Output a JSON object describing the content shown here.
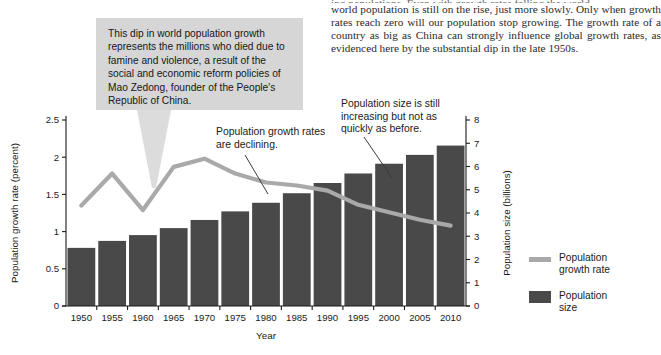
{
  "body_copy": {
    "clipped_top_line": "ing populations. Even with growth rates falling the world",
    "paragraph": "world population is still on the rise, just more slowly. Only when growth rates reach zero will our population stop growing. The growth rate of a country as big as China can strongly influence global growth rates, as evidenced here by the substantial dip in the late 1950s."
  },
  "callout": {
    "text": "This dip in world population growth represents the millions who died due to famine and violence, a result of the social and economic reform policies of Mao Zedong, founder of the People's Republic of China.",
    "pointer_color": "#dcdcdc",
    "background_color": "#d6d6d6"
  },
  "annotations": [
    {
      "id": "growth-declining",
      "text": "Population growth rates are declining."
    },
    {
      "id": "size-increasing",
      "text": "Population size is still increasing but not as quickly as before."
    }
  ],
  "legend": {
    "items": [
      {
        "label_line1": "Population",
        "label_line2": "growth rate",
        "swatch": "line",
        "color": "#a9a9a9"
      },
      {
        "label_line1": "Population",
        "label_line2": "size",
        "swatch": "bar",
        "color": "#494949"
      }
    ]
  },
  "chart_data": {
    "type": "bar",
    "title": "",
    "xlabel": "Year",
    "ylabel": "Population growth rate (percent)",
    "y2label": "Population size (billions)",
    "categories": [
      "1950",
      "1955",
      "1960",
      "1965",
      "1970",
      "1975",
      "1980",
      "1985",
      "1990",
      "1995",
      "2000",
      "2005",
      "2010"
    ],
    "ylim": [
      0,
      2.5
    ],
    "yticks": [
      "0",
      "0.5",
      "1",
      "1.5",
      "2",
      "2.5"
    ],
    "y2lim": [
      0,
      8
    ],
    "y2ticks": [
      "0",
      "1",
      "2",
      "3",
      "4",
      "5",
      "6",
      "7",
      "8"
    ],
    "grid": false,
    "legend_position": "right",
    "series": [
      {
        "name": "Population size",
        "type": "bar",
        "axis": "right",
        "unit": "billions",
        "color": "#494949",
        "values": [
          2.5,
          2.8,
          3.05,
          3.35,
          3.7,
          4.07,
          4.44,
          4.85,
          5.29,
          5.7,
          6.12,
          6.5,
          6.9
        ]
      },
      {
        "name": "Population growth rate",
        "type": "line",
        "axis": "left",
        "unit": "percent",
        "color": "#a9a9a9",
        "values": [
          1.35,
          1.78,
          1.29,
          1.87,
          1.98,
          1.78,
          1.66,
          1.62,
          1.55,
          1.36,
          1.26,
          1.16,
          1.08
        ]
      }
    ]
  }
}
